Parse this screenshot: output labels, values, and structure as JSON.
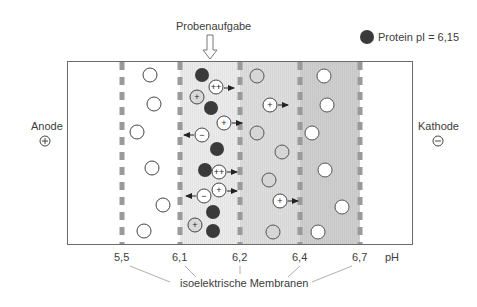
{
  "title": "Probenaufgabe",
  "legend": {
    "label": "Protein pI = 6,15",
    "color": "#3a3a3a"
  },
  "electrodes": {
    "anode": {
      "label": "Anode",
      "symbol": "⊕"
    },
    "cathode": {
      "label": "Kathode",
      "symbol": "⊖"
    }
  },
  "ph_axis": {
    "unit": "pH",
    "ticks": [
      "5,5",
      "6,1",
      "6,2",
      "6,4",
      "6,7"
    ]
  },
  "membrane_caption": "isoelektrische Membranen",
  "colors": {
    "frame": "#6b6b6b",
    "membrane": "#9a9a9a",
    "chamber_1": "#ffffff",
    "chamber_2": "#ebebeb",
    "chamber_3": "#dcdcdc",
    "chamber_4": "#cfcfcf",
    "protein": "#3a3a3a",
    "ion_fill": "#ffffff",
    "ion_stroke": "#555555"
  },
  "chambers": [
    {
      "ph_range": "5,5–6,1",
      "particles": "neutral white circles"
    },
    {
      "ph_range": "6,1–6,2",
      "particles": "protein pI 6,15 (dark) + charged ions migrating"
    },
    {
      "ph_range": "6,2–6,4",
      "particles": "light gray circles, charged (+) ions migrating"
    },
    {
      "ph_range": "6,4–6,7",
      "particles": "white circles"
    }
  ],
  "charge_labels": {
    "plus": "+",
    "minus": "−",
    "double_plus": "++"
  }
}
